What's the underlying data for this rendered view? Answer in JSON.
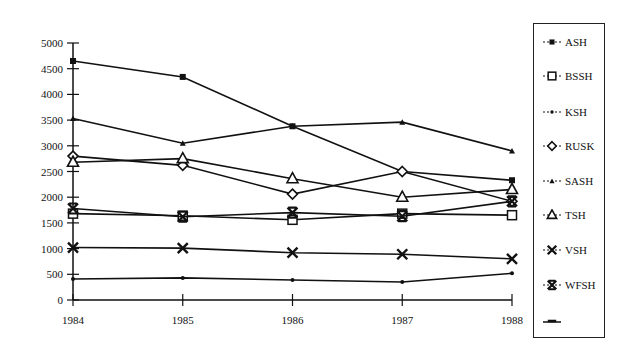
{
  "chart_data": {
    "type": "line",
    "title": "",
    "xlabel": "",
    "ylabel": "",
    "x": [
      "1984",
      "1985",
      "1986",
      "1987",
      "1988"
    ],
    "categories": [
      "1984",
      "1985",
      "1986",
      "1987",
      "1988"
    ],
    "ylim": [
      0,
      5000
    ],
    "yticks": [
      0,
      500,
      1000,
      1500,
      2000,
      2500,
      3000,
      3500,
      4000,
      4500,
      5000
    ],
    "grid": false,
    "legend_position": "right",
    "series": [
      {
        "name": "ASH",
        "marker": "filled-square",
        "values": [
          4650,
          4340,
          3380,
          2500,
          2330
        ]
      },
      {
        "name": "BSSH",
        "marker": "open-square",
        "values": [
          1680,
          1640,
          1560,
          1680,
          1650
        ]
      },
      {
        "name": "KSH",
        "marker": "small-dot",
        "values": [
          410,
          430,
          390,
          350,
          520
        ]
      },
      {
        "name": "RUSK",
        "marker": "open-diamond",
        "values": [
          2800,
          2620,
          2060,
          2500,
          1920
        ]
      },
      {
        "name": "SASH",
        "marker": "small-triangle",
        "values": [
          3530,
          3050,
          3380,
          3460,
          2900
        ]
      },
      {
        "name": "TSH",
        "marker": "open-triangle",
        "values": [
          2680,
          2750,
          2360,
          2000,
          2150
        ]
      },
      {
        "name": "VSH",
        "marker": "x-cross",
        "values": [
          1020,
          1010,
          920,
          890,
          800
        ]
      },
      {
        "name": "WFSH",
        "marker": "bowtie-cross",
        "values": [
          1780,
          1620,
          1700,
          1630,
          1920
        ]
      }
    ],
    "legend_entries": [
      "ASH",
      "BSSH",
      "KSH",
      "RUSK",
      "SASH",
      "TSH",
      "VSH",
      "WFSH",
      ""
    ]
  },
  "legend": {
    "items": [
      {
        "label": "ASH",
        "marker": "filled-square"
      },
      {
        "label": "BSSH",
        "marker": "open-square"
      },
      {
        "label": "KSH",
        "marker": "small-dot"
      },
      {
        "label": "RUSK",
        "marker": "open-diamond"
      },
      {
        "label": "SASH",
        "marker": "small-triangle"
      },
      {
        "label": "TSH",
        "marker": "open-triangle"
      },
      {
        "label": "VSH",
        "marker": "x-cross"
      },
      {
        "label": "WFSH",
        "marker": "bowtie-cross"
      },
      {
        "label": "",
        "marker": "dash"
      }
    ]
  },
  "colors": {
    "line": "#111111",
    "background": "#ffffff"
  }
}
